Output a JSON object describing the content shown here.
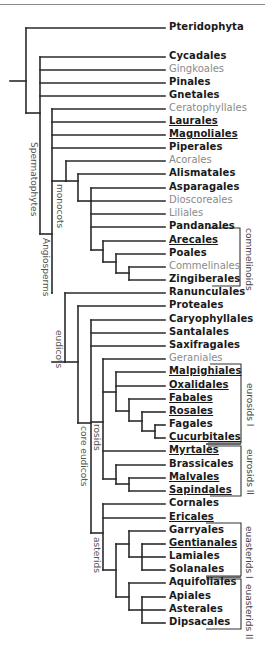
{
  "diagram": {
    "type": "phylogenetic-tree",
    "taxa": [
      {
        "name": "Pteridophyta",
        "y": 28,
        "style": "bold"
      },
      {
        "name": "Cycadales",
        "y": 57,
        "style": "bold"
      },
      {
        "name": "Gingkoales",
        "y": 70,
        "style": "light"
      },
      {
        "name": "Pinales",
        "y": 83,
        "style": "bold"
      },
      {
        "name": "Gnetales",
        "y": 96,
        "style": "bold"
      },
      {
        "name": "Ceratophyllales",
        "y": 109,
        "style": "light"
      },
      {
        "name": "Laurales",
        "y": 122,
        "style": "bold-ul"
      },
      {
        "name": "Magnoliales",
        "y": 135,
        "style": "bold-ul"
      },
      {
        "name": "Piperales",
        "y": 148,
        "style": "bold"
      },
      {
        "name": "Acorales",
        "y": 161,
        "style": "light"
      },
      {
        "name": "Alismatales",
        "y": 174,
        "style": "bold"
      },
      {
        "name": "Asparagales",
        "y": 188,
        "style": "bold"
      },
      {
        "name": "Dioscoreales",
        "y": 201,
        "style": "light"
      },
      {
        "name": "Liliales",
        "y": 214,
        "style": "light"
      },
      {
        "name": "Pandanales",
        "y": 227,
        "style": "bold"
      },
      {
        "name": "Arecales",
        "y": 241,
        "style": "bold-ul"
      },
      {
        "name": "Poales",
        "y": 254,
        "style": "bold"
      },
      {
        "name": "Commelinales",
        "y": 267,
        "style": "light"
      },
      {
        "name": "Zingiberales",
        "y": 280,
        "style": "bold"
      },
      {
        "name": "Ranunculales",
        "y": 293,
        "style": "bold"
      },
      {
        "name": "Proteales",
        "y": 306,
        "style": "bold"
      },
      {
        "name": "Caryophyllales",
        "y": 320,
        "style": "bold"
      },
      {
        "name": "Santalales",
        "y": 333,
        "style": "bold"
      },
      {
        "name": "Saxifragales",
        "y": 346,
        "style": "bold"
      },
      {
        "name": "Geraniales",
        "y": 359,
        "style": "light"
      },
      {
        "name": "Malpighiales",
        "y": 372,
        "style": "bold-ul"
      },
      {
        "name": "Oxalidales",
        "y": 386,
        "style": "bold-ul"
      },
      {
        "name": "Fabales",
        "y": 399,
        "style": "bold-ul"
      },
      {
        "name": "Rosales",
        "y": 412,
        "style": "bold-ul"
      },
      {
        "name": "Fagales",
        "y": 425,
        "style": "bold"
      },
      {
        "name": "Cucurbitales",
        "y": 438,
        "style": "bold-ul"
      },
      {
        "name": "Myrtales",
        "y": 451,
        "style": "bold-ul"
      },
      {
        "name": "Brassicales",
        "y": 465,
        "style": "bold"
      },
      {
        "name": "Malvales",
        "y": 478,
        "style": "bold-ul"
      },
      {
        "name": "Sapindales",
        "y": 491,
        "style": "bold-ul"
      },
      {
        "name": "Cornales",
        "y": 504,
        "style": "bold"
      },
      {
        "name": "Ericales",
        "y": 518,
        "style": "bold-ul"
      },
      {
        "name": "Garryales",
        "y": 531,
        "style": "bold"
      },
      {
        "name": "Gentianales",
        "y": 544,
        "style": "bold-ul"
      },
      {
        "name": "Lamiales",
        "y": 557,
        "style": "bold"
      },
      {
        "name": "Solanales",
        "y": 570,
        "style": "bold"
      },
      {
        "name": "Aquifoliales",
        "y": 583,
        "style": "bold"
      },
      {
        "name": "Apiales",
        "y": 597,
        "style": "bold"
      },
      {
        "name": "Asterales",
        "y": 610,
        "style": "bold"
      },
      {
        "name": "Dipsacales",
        "y": 623,
        "style": "bold"
      }
    ],
    "clade_labels": {
      "spermatophytes": "Spermatophytes",
      "angiosperms": "Angiosperms",
      "monocots": "monocots",
      "eudicots": "eudicots",
      "core_eudicots": "core eudicots",
      "rosids": "rosids",
      "asterids": "asterids"
    },
    "bracket_labels": {
      "commelinoids": "commelinoids",
      "eurosids_1": "eurosids I",
      "eurosids_2": "eurosids II",
      "euasterids_1": "euasterids I",
      "euasterids_2": "euasterids II"
    },
    "colors": {
      "line": "#2a2a2a",
      "bold_text": "#1a1a1a",
      "light_text": "#8a8a8a",
      "bracket": "#333333"
    }
  }
}
